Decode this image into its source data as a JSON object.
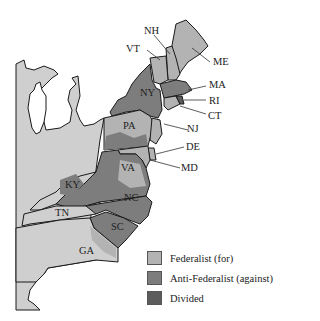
{
  "map": {
    "colors": {
      "federalist": "#b3b3b3",
      "anti_federalist": "#7d7d7d",
      "divided": "#5c5c5c",
      "territory": "#cfcfcf",
      "water": "#ffffff",
      "border": "#1a1a1a"
    },
    "state_labels": [
      {
        "id": "NH",
        "text": "NH"
      },
      {
        "id": "VT",
        "text": "VT"
      },
      {
        "id": "ME",
        "text": "ME"
      },
      {
        "id": "MA",
        "text": "MA"
      },
      {
        "id": "NY",
        "text": "NY"
      },
      {
        "id": "RI",
        "text": "RI"
      },
      {
        "id": "CT",
        "text": "CT"
      },
      {
        "id": "PA",
        "text": "PA"
      },
      {
        "id": "NJ",
        "text": "NJ"
      },
      {
        "id": "DE",
        "text": "DE"
      },
      {
        "id": "MD",
        "text": "MD"
      },
      {
        "id": "VA",
        "text": "VA"
      },
      {
        "id": "KY",
        "text": "KY"
      },
      {
        "id": "NC",
        "text": "NC"
      },
      {
        "id": "TN",
        "text": "TN"
      },
      {
        "id": "SC",
        "text": "SC"
      },
      {
        "id": "GA",
        "text": "GA"
      }
    ]
  },
  "legend": {
    "items": [
      {
        "label": "Federalist (for)",
        "color": "#b3b3b3"
      },
      {
        "label": "Anti-Federalist (against)",
        "color": "#7d7d7d"
      },
      {
        "label": "Divided",
        "color": "#5c5c5c"
      }
    ]
  }
}
